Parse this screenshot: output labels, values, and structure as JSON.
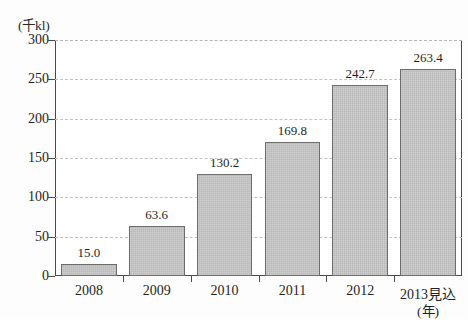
{
  "chart_data": {
    "type": "bar",
    "title": "",
    "subtitle": "",
    "unit_label": "(千kl)",
    "xlabel": "(年)",
    "ylabel": "",
    "categories": [
      "2008",
      "2009",
      "2010",
      "2011",
      "2012",
      "2013見込"
    ],
    "values": [
      15.0,
      63.6,
      130.2,
      169.8,
      242.7,
      263.4
    ],
    "value_labels": [
      "15.0",
      "63.6",
      "130.2",
      "169.8",
      "242.7",
      "263.4"
    ],
    "ylim": [
      0,
      300
    ],
    "ytick_step": 50,
    "ytick_labels": [
      "0",
      "50",
      "100",
      "150",
      "200",
      "250",
      "300"
    ],
    "ytick_values": [
      0,
      50,
      100,
      150,
      200,
      250,
      300
    ],
    "grid": true,
    "grid_style": "dashed",
    "legend": false,
    "legend_position": "none",
    "bar_fill_color": "#b9b9b9",
    "bar_border_color": "#6d6d6d",
    "grid_color": "#c2c2c2",
    "axis_color": "#4a4a4a",
    "text_color": "#1f1f1f",
    "background_color": "#fdfdfd"
  }
}
